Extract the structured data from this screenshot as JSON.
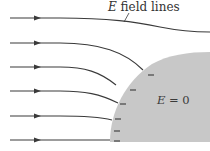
{
  "diagram": {
    "title_label": {
      "symbol": "E",
      "text": " field lines"
    },
    "interior_label": {
      "symbol": "E",
      "text": " = 0"
    },
    "colors": {
      "background": "#ffffff",
      "conductor_fill": "#c8c8c8",
      "line_color": "#3a3a3a",
      "text_color": "#333333"
    },
    "field_lines_count": 6,
    "surface_charge_sign": "−",
    "surface_charge_count": 7
  }
}
